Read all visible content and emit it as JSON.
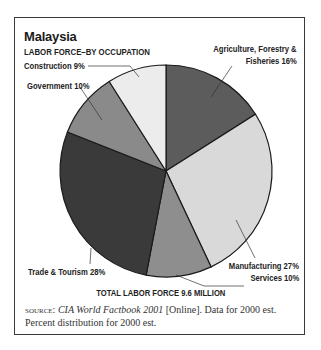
{
  "title": "Malaysia",
  "subtitle": "LABOR FORCE–BY OCCUPATION",
  "total_label": "TOTAL LABOR FORCE 9.6 MILLION",
  "source": {
    "prefix": "source:",
    "italic": "CIA World Factbook 2001",
    "rest_line1": " [Online]. Data for 2000 est.",
    "line2": "Percent distribution for 2000 est."
  },
  "labels": {
    "agriculture_line1": "Agriculture, Forestry &",
    "agriculture_line2": "Fisheries 16%",
    "manufacturing": "Manufacturing 27%",
    "services": "Services 10%",
    "trade": "Trade & Tourism 28%",
    "government": "Government 10%",
    "construction": "Construction 9%"
  },
  "chart_data": {
    "type": "pie",
    "title": "Malaysia",
    "subtitle": "LABOR FORCE–BY OCCUPATION",
    "categories": [
      "Agriculture, Forestry & Fisheries",
      "Manufacturing",
      "Services",
      "Trade & Tourism",
      "Government",
      "Construction"
    ],
    "values": [
      16,
      27,
      10,
      28,
      10,
      9
    ],
    "unit": "%",
    "colors": [
      "#5c5c5c",
      "#d9d9d9",
      "#8e8e8e",
      "#3a3a3a",
      "#8a8a8a",
      "#ececec"
    ],
    "start_angle": "12 o'clock, clockwise",
    "annotation": "TOTAL LABOR FORCE 9.6 MILLION",
    "legend": "none (direct labels with leader lines)"
  }
}
